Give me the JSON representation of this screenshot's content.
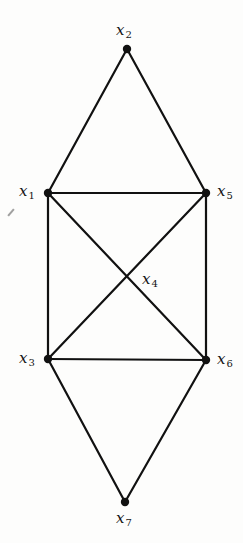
{
  "diagram": {
    "type": "undirected-graph",
    "nodes": [
      {
        "id": "x1",
        "var": "x",
        "sub": "1",
        "x": 48,
        "y": 193,
        "label_x": 19,
        "label_y": 184
      },
      {
        "id": "x2",
        "var": "x",
        "sub": "2",
        "x": 127,
        "y": 49,
        "label_x": 116,
        "label_y": 23
      },
      {
        "id": "x3",
        "var": "x",
        "sub": "3",
        "x": 48,
        "y": 359,
        "label_x": 19,
        "label_y": 351
      },
      {
        "id": "x4",
        "var": "x",
        "sub": "4",
        "x": 127,
        "y": 277,
        "label_x": 142,
        "label_y": 272
      },
      {
        "id": "x5",
        "var": "x",
        "sub": "5",
        "x": 206,
        "y": 193,
        "label_x": 217,
        "label_y": 184
      },
      {
        "id": "x6",
        "var": "x",
        "sub": "6",
        "x": 206,
        "y": 360,
        "label_x": 217,
        "label_y": 352
      },
      {
        "id": "x7",
        "var": "x",
        "sub": "7",
        "x": 125,
        "y": 502,
        "label_x": 116,
        "label_y": 511
      }
    ],
    "edges": [
      [
        "x2",
        "x1"
      ],
      [
        "x2",
        "x5"
      ],
      [
        "x1",
        "x5"
      ],
      [
        "x1",
        "x3"
      ],
      [
        "x5",
        "x6"
      ],
      [
        "x3",
        "x6"
      ],
      [
        "x1",
        "x6"
      ],
      [
        "x5",
        "x3"
      ],
      [
        "x3",
        "x7"
      ],
      [
        "x6",
        "x7"
      ]
    ],
    "dotted_nodes": [
      "x1",
      "x2",
      "x3",
      "x5",
      "x6",
      "x7"
    ]
  }
}
